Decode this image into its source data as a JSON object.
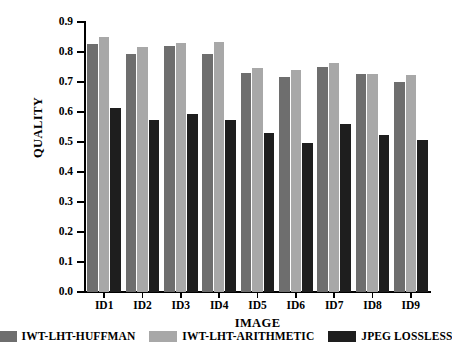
{
  "chart_data": {
    "type": "bar",
    "title": "",
    "xlabel": "IMAGE",
    "ylabel": "QUALITY",
    "categories": [
      "ID1",
      "ID2",
      "ID3",
      "ID4",
      "ID5",
      "ID6",
      "ID7",
      "ID8",
      "ID9"
    ],
    "ylim": [
      0.0,
      0.9
    ],
    "ytick_labels": [
      "0.9",
      "0.8",
      "0.7",
      "0.6",
      "0.5",
      "0.4",
      "0.3",
      "0.2",
      "0.1",
      "0.0"
    ],
    "ytick_values": [
      0.9,
      0.8,
      0.7,
      0.6,
      0.5,
      0.4,
      0.3,
      0.2,
      0.1,
      0.0
    ],
    "grid": false,
    "legend_position": "bottom",
    "series": [
      {
        "name": "IWT-LHT-HUFFMAN",
        "color": "#6e6e6e",
        "values": [
          0.827,
          0.793,
          0.82,
          0.793,
          0.73,
          0.717,
          0.75,
          0.727,
          0.7
        ]
      },
      {
        "name": "IWT-LHT-ARITHMETIC",
        "color": "#a8a8a8",
        "values": [
          0.85,
          0.817,
          0.83,
          0.833,
          0.747,
          0.74,
          0.763,
          0.727,
          0.723
        ]
      },
      {
        "name": "JPEG LOSSLESS",
        "color": "#1e1e1e",
        "values": [
          0.615,
          0.573,
          0.593,
          0.573,
          0.53,
          0.497,
          0.56,
          0.523,
          0.507
        ]
      }
    ]
  }
}
